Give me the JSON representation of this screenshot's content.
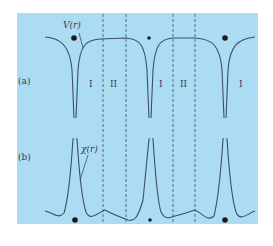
{
  "figure": {
    "background_color": "#abdcf4",
    "curve_color": "#3f4f5f",
    "panel_a": {
      "label": "(a)",
      "curve_label": "V(r)",
      "region_labels": [
        "I",
        "II",
        "I",
        "II",
        "I"
      ]
    },
    "panel_b": {
      "label": "(b)",
      "curve_label": "χ(r)"
    },
    "dashed_lines_x": [
      103,
      126,
      173,
      195
    ],
    "atom_positions_x": [
      74,
      149,
      225
    ]
  }
}
